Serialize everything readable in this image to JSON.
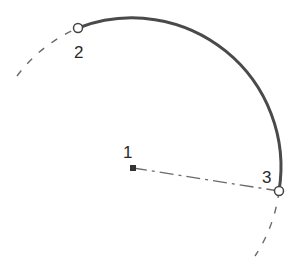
{
  "diagram": {
    "type": "arc-by-center-start-end",
    "colors": {
      "arc": "#4a4a4a",
      "construction": "#6a6a6a",
      "point": "#333333",
      "background": "#ffffff"
    },
    "points": [
      {
        "id": "1",
        "label": "1",
        "role": "center",
        "x": 133,
        "y": 168,
        "marker": "filled-square"
      },
      {
        "id": "2",
        "label": "2",
        "role": "start",
        "x": 78,
        "y": 28,
        "marker": "open-circle"
      },
      {
        "id": "3",
        "label": "3",
        "role": "end",
        "x": 279,
        "y": 191,
        "marker": "open-circle"
      }
    ],
    "labels": {
      "p1": "1",
      "p2": "2",
      "p3": "3"
    },
    "arc": {
      "style": "solid",
      "from": "2",
      "to": "3",
      "radius": 149
    },
    "construction_lines": [
      {
        "style": "dashed",
        "description": "circle extension before point 2"
      },
      {
        "style": "dash-dot",
        "description": "radius line from point 1 to point 3"
      },
      {
        "style": "dashed",
        "description": "circle extension after point 3"
      }
    ]
  }
}
